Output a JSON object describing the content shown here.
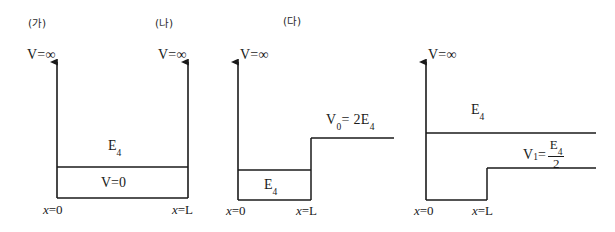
{
  "figure": {
    "kind": "potential-well-energy-level-diagrams",
    "background": "#ffffff",
    "line_color": "#1a1a1a",
    "panels": [
      {
        "id": "panel-a",
        "title": "(가)",
        "left_axis_label": "V=∞",
        "right_axis_label": "V=∞",
        "energy_label": "E",
        "energy_subscript": "4",
        "inside_label": "V=0",
        "x_left_label_var": "x",
        "x_left_label_value": "=0",
        "x_right_label_var": "x",
        "x_right_label_value": "=L"
      },
      {
        "id": "panel-b",
        "title": "(나)"
      },
      {
        "id": "panel-c",
        "title": "(다)",
        "left_axis_label": "V=∞",
        "energy_label": "E",
        "energy_subscript": "4",
        "step_label_var": "V",
        "step_label_var_sub": "0",
        "step_label_value": "=  2E",
        "step_label_value_sub": "4",
        "x_left_label_var": "x",
        "x_left_label_value": "=0",
        "x_right_label_var": "x",
        "x_right_label_value": "=L"
      },
      {
        "id": "panel-d",
        "left_axis_label": "V=∞",
        "energy_label": "E",
        "energy_subscript": "4",
        "step_label_var": "V",
        "step_label_var_sub": "1",
        "step_label_eq": "=",
        "step_numerator": "E",
        "step_numerator_sub": "4",
        "step_denominator": "2",
        "x_left_label_var": "x",
        "x_left_label_value": "=0",
        "x_right_label_var": "x",
        "x_right_label_value": "=L"
      }
    ]
  }
}
